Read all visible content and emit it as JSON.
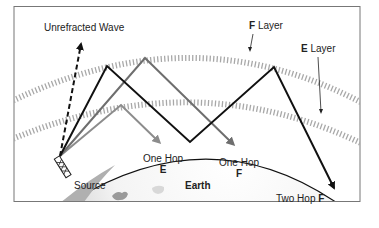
{
  "labels": {
    "unrefracted_wave": "Unrefracted Wave",
    "f_layer_letter": "F",
    "f_layer_word": "Layer",
    "e_layer_letter": "E",
    "e_layer_word": "Layer",
    "source": "Source",
    "one_hop_e_line1": "One Hop",
    "one_hop_e_line2": "E",
    "one_hop_f_line1": "One Hop",
    "one_hop_f_line2": "F",
    "earth": "Earth",
    "two_hop_f_text": "Two Hop",
    "two_hop_f_letter": "F"
  },
  "colors": {
    "frame": "#777777",
    "earth_edge": "#111111",
    "earth_fill_light": "#ffffff",
    "earth_fill_dark": "#b8b8b8",
    "continent": "#9a9a9a",
    "layer_hatch": "#a8a8a8",
    "ray_black": "#111111",
    "ray_gray": "#6e6e6e",
    "ray_lightgray": "#8c8c8c"
  }
}
